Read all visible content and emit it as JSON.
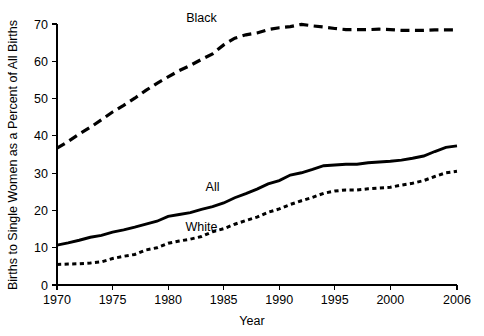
{
  "chart_data": {
    "type": "line",
    "title": "",
    "xlabel": "Year",
    "ylabel": "Births to Single Women as a Percent of All Births",
    "xlim": [
      1970,
      2006
    ],
    "ylim": [
      0,
      70
    ],
    "xticks": [
      1970,
      1975,
      1980,
      1985,
      1990,
      1995,
      2000,
      2006
    ],
    "xtick_labels": [
      "1970",
      "1975",
      "1980",
      "1985",
      "1990",
      "1995",
      "2000",
      "2006"
    ],
    "yticks": [
      0,
      10,
      20,
      30,
      40,
      50,
      60,
      70
    ],
    "ytick_labels": [
      "0",
      "10",
      "20",
      "30",
      "40",
      "50",
      "60",
      "70"
    ],
    "grid": false,
    "legend_position": "inline-annotations",
    "x": [
      1970,
      1971,
      1972,
      1973,
      1974,
      1975,
      1976,
      1977,
      1978,
      1979,
      1980,
      1981,
      1982,
      1983,
      1984,
      1985,
      1986,
      1987,
      1988,
      1989,
      1990,
      1991,
      1992,
      1993,
      1994,
      1995,
      1996,
      1997,
      1998,
      1999,
      2000,
      2001,
      2002,
      2003,
      2004,
      2005,
      2006
    ],
    "series": [
      {
        "name": "Black",
        "style": "dashed-long",
        "label_x": 1983.0,
        "label_y": 70.5,
        "values": [
          36.7,
          38.5,
          40.5,
          42.3,
          44.3,
          46.4,
          48.2,
          50.1,
          52.2,
          54.1,
          55.8,
          57.5,
          58.9,
          60.5,
          62.0,
          64.4,
          66.2,
          67.1,
          67.6,
          68.5,
          69.0,
          69.3,
          69.9,
          69.5,
          69.2,
          68.8,
          68.5,
          68.5,
          68.5,
          68.6,
          68.5,
          68.3,
          68.3,
          68.3,
          68.4,
          68.4,
          68.4
        ]
      },
      {
        "name": "All",
        "style": "solid",
        "label_x": 1984.0,
        "label_y": 25.2,
        "values": [
          10.7,
          11.3,
          12.0,
          12.8,
          13.3,
          14.2,
          14.8,
          15.5,
          16.3,
          17.1,
          18.4,
          18.9,
          19.4,
          20.3,
          21.0,
          22.0,
          23.4,
          24.5,
          25.7,
          27.1,
          28.0,
          29.5,
          30.1,
          31.0,
          32.0,
          32.2,
          32.4,
          32.4,
          32.8,
          33.0,
          33.2,
          33.5,
          34.0,
          34.6,
          35.8,
          36.9,
          37.3
        ]
      },
      {
        "name": "White",
        "style": "dotted",
        "label_x": 1983.0,
        "label_y": 14.5,
        "values": [
          5.5,
          5.6,
          5.7,
          5.9,
          6.2,
          7.1,
          7.7,
          8.2,
          9.4,
          10.0,
          11.2,
          11.8,
          12.3,
          13.0,
          14.3,
          15.1,
          16.3,
          17.3,
          18.2,
          19.5,
          20.4,
          21.6,
          22.6,
          23.5,
          24.6,
          25.2,
          25.5,
          25.5,
          25.8,
          26.0,
          26.2,
          26.8,
          27.3,
          28.0,
          29.1,
          30.1,
          30.5
        ]
      }
    ]
  },
  "geometry": {
    "plot_left": 57,
    "plot_right": 457,
    "plot_top": 24,
    "plot_bottom": 285
  }
}
